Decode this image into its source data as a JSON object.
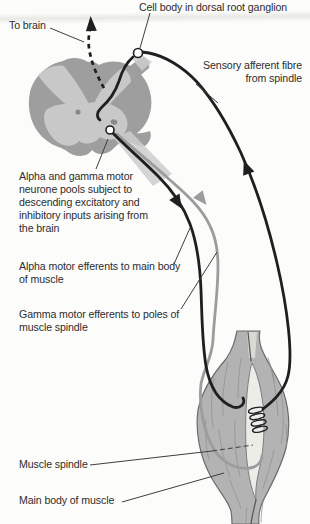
{
  "labels": {
    "to_brain": "To brain",
    "cell_body": "Cell body in dorsal root ganglion",
    "sensory_afferent": "Sensory afferent fibre\nfrom spindle",
    "motor_pools": "Alpha and gamma motor\nneurone pools subject to\ndescending excitatory and\ninhibitory inputs arising from\nthe brain",
    "alpha_efferents": "Alpha motor efferents to main body\nof muscle",
    "gamma_efferents": "Gamma motor efferents to poles of\nmuscle spindle",
    "muscle_spindle": "Muscle spindle",
    "main_body": "Main body of muscle"
  },
  "colors": {
    "background": "#fcfcfb",
    "fibre_dark": "#1f1f1f",
    "fibre_gray": "#9c9c9c",
    "cord_outer": "#9e9e9e",
    "cord_inner": "#c8c8c8",
    "cord_spot": "#8a8a8a",
    "muscle_fill": "#b3b3b3",
    "muscle_outline": "#6b6b6b",
    "muscle_striation": "#8e8e8e",
    "spindle_fill": "#ecece9",
    "spindle_outline": "#7d7d7d",
    "leader": "#3d3d3d",
    "text": "#2d2d2d"
  }
}
